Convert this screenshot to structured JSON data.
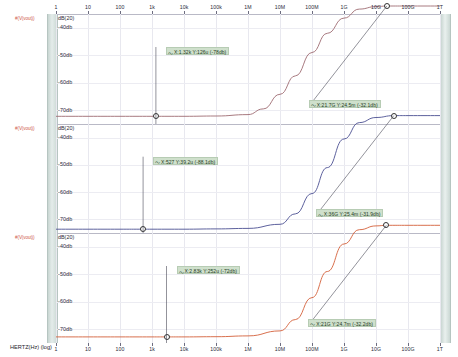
{
  "chart_data": {
    "type": "line",
    "title": "",
    "xlabel": "HERTZ(Hz) (log)",
    "xscale": "log",
    "xlim": [
      1,
      1000000000000.0
    ],
    "xticks": [
      "1",
      "10",
      "100",
      "1k",
      "10k",
      "100k",
      "1M",
      "10M",
      "100M",
      "1G",
      "10G",
      "100G",
      "1T"
    ],
    "grid": true,
    "legend_position": "left-margin",
    "panels": [
      {
        "name": "panel-1",
        "trace_label": "#(V(vout))",
        "color": "#9e6b72",
        "ylabel": "dB(20)",
        "yticks": [
          "-40db",
          "-50db",
          "-60db",
          "-70db"
        ],
        "ylim": [
          -75,
          -35
        ],
        "series": [
          {
            "name": "trace-1",
            "x": [
              1,
              10,
              100,
              1000,
              10000,
              100000,
              1000000,
              3000000,
              10000000,
              30000000,
              100000000,
              300000000,
              1000000000,
              3000000000,
              10000000000,
              21700000000,
              100000000000,
              1000000000000
            ],
            "y": [
              -72.2,
              -72.2,
              -72.2,
              -72.2,
              -72.2,
              -72.1,
              -71.6,
              -69.5,
              -64.2,
              -57.5,
              -49.0,
              -42.0,
              -36.5,
              -33.2,
              -32.3,
              -32.1,
              -32.1,
              -32.1
            ]
          }
        ],
        "annotations": [
          {
            "name": "cursor-1",
            "text": "X:1.32k Y:126u (-78db)",
            "x": 1320,
            "y": -72.2
          },
          {
            "name": "cursor-2",
            "text": "X:21.7G Y:24.5m (-32.1db)",
            "x": 21700000000,
            "y": -32.1
          }
        ]
      },
      {
        "name": "panel-2",
        "trace_label": "#(V(vout))",
        "color": "#4b4f92",
        "ylabel": "dB(20)",
        "yticks": [
          "-40db",
          "-50db",
          "-60db",
          "-70db"
        ],
        "ylim": [
          -75,
          -35
        ],
        "series": [
          {
            "name": "trace-2",
            "x": [
              1,
              10,
              100,
              527,
              1000,
              10000,
              100000,
              1000000,
              10000000,
              30000000,
              100000000,
              300000000,
              1000000000,
              3000000000,
              10000000000,
              36000000000,
              100000000000,
              1000000000000
            ],
            "y": [
              -73.6,
              -73.6,
              -73.6,
              -73.6,
              -73.6,
              -73.6,
              -73.5,
              -73.3,
              -71.8,
              -68.0,
              -60.5,
              -51.0,
              -40.5,
              -34.5,
              -32.6,
              -31.9,
              -31.9,
              -31.9
            ]
          }
        ],
        "annotations": [
          {
            "name": "cursor-3",
            "text": "X:527 Y:39.2u (-88.1db)",
            "x": 527,
            "y": -73.6
          },
          {
            "name": "cursor-4",
            "text": "X:36G Y:25.4m (-31.9db)",
            "x": 36000000000,
            "y": -31.9
          }
        ]
      },
      {
        "name": "panel-3",
        "trace_label": "#(V(vout))",
        "color": "#d4603a",
        "ylabel": "dB(20)",
        "yticks": [
          "-40db",
          "-50db",
          "-60db",
          "-70db"
        ],
        "ylim": [
          -75,
          -35
        ],
        "series": [
          {
            "name": "trace-3",
            "x": [
              1,
              10,
              100,
              1000,
              2830,
              10000,
              100000,
              1000000,
              10000000,
              30000000,
              100000000,
              300000000,
              1000000000,
              3000000000,
              10000000000,
              21000000000,
              100000000000,
              1000000000000
            ],
            "y": [
              -72.8,
              -72.8,
              -72.8,
              -72.8,
              -72.8,
              -72.8,
              -72.7,
              -72.4,
              -70.6,
              -66.5,
              -58.5,
              -49.0,
              -39.0,
              -33.8,
              -32.4,
              -32.2,
              -32.2,
              -32.2
            ]
          }
        ],
        "annotations": [
          {
            "name": "cursor-5",
            "text": "X:2.83k Y:252u (-72db)",
            "x": 2830,
            "y": -72.8
          },
          {
            "name": "cursor-6",
            "text": "X:21G Y:24.7m (-32.2db)",
            "x": 21000000000,
            "y": -32.2
          }
        ]
      }
    ]
  },
  "axis": {
    "x_label": "HERTZ(Hz) (log)",
    "y_unit": "dB(20)"
  }
}
